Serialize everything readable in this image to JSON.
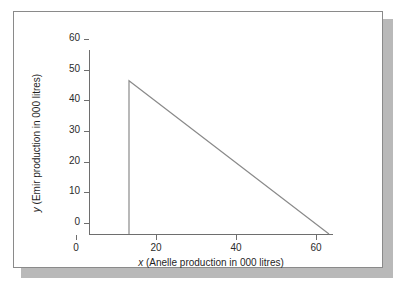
{
  "chart_data": {
    "type": "line",
    "title": "",
    "xlabel": "x (Anelle production in 000 litres)",
    "ylabel": "y (Emir production in 000 litres)",
    "xlabel_var": "x",
    "xlabel_rest": " (Anelle production in 000 litres)",
    "ylabel_var": "y",
    "ylabel_rest": " (Emir production in 000 litres)",
    "xlim": [
      0,
      60
    ],
    "ylim": [
      0,
      60
    ],
    "xticks": [
      0,
      20,
      40,
      60
    ],
    "yticks": [
      0,
      10,
      20,
      30,
      40,
      50,
      60
    ],
    "xtick_labels": [
      "0",
      "20",
      "40",
      "60"
    ],
    "ytick_labels": [
      "0",
      "10",
      "20",
      "30",
      "40",
      "50",
      "60"
    ],
    "grid": false,
    "legend": false,
    "line_color": "#8a8a8a",
    "axis_color": "#6e6e6e",
    "series": [
      {
        "name": "constraint-boundary",
        "points": [
          {
            "x": 10,
            "y": 0
          },
          {
            "x": 10,
            "y": 50
          },
          {
            "x": 60,
            "y": 0
          }
        ]
      }
    ],
    "annotations": []
  },
  "figure": {
    "frame_border_color": "#8a8a8a",
    "shadow_color": "#b9b9b9",
    "background": "#ffffff"
  }
}
